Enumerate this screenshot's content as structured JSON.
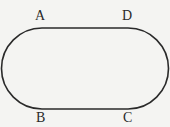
{
  "diagram": {
    "shape": "stadium",
    "stroke_color": "#2a2a2a",
    "background": "#f4f4f2",
    "points": [
      {
        "label": "A",
        "position": "top-left"
      },
      {
        "label": "D",
        "position": "top-right"
      },
      {
        "label": "B",
        "position": "bottom-left"
      },
      {
        "label": "C",
        "position": "bottom-right"
      }
    ]
  }
}
